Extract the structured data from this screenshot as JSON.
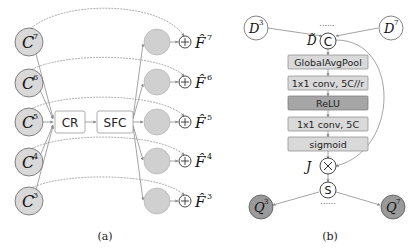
{
  "panel_a": {
    "caption": "(a)",
    "inputs": [
      {
        "base": "C",
        "sup": "7"
      },
      {
        "base": "C",
        "sup": "6"
      },
      {
        "base": "C",
        "sup": "5"
      },
      {
        "base": "C",
        "sup": "4"
      },
      {
        "base": "C",
        "sup": "3"
      }
    ],
    "cr_label": "CR",
    "sfc_label": "SFC",
    "outputs": [
      {
        "base": "F̂",
        "sup": "7"
      },
      {
        "base": "F̂",
        "sup": "6"
      },
      {
        "base": "F̂",
        "sup": "5"
      },
      {
        "base": "F̂",
        "sup": "4"
      },
      {
        "base": "F̂",
        "sup": "3"
      }
    ],
    "add_symbol": "+"
  },
  "panel_b": {
    "caption": "(b)",
    "d_left": {
      "base": "D",
      "sup": "3"
    },
    "d_right": {
      "base": "D",
      "sup": "7"
    },
    "dots_top": "......",
    "concat_label": "C",
    "d_tilde": "D̃",
    "layers": [
      {
        "label": "GlobalAvgPool",
        "fill": "#d9d9d9"
      },
      {
        "label": "1x1 conv, 5C//r",
        "fill": "#d9d9d9"
      },
      {
        "label": "ReLU",
        "fill": "#a6a6a6"
      },
      {
        "label": "1x1 conv, 5C",
        "fill": "#d9d9d9"
      },
      {
        "label": "sigmoid",
        "fill": "#d9d9d9"
      }
    ],
    "mult_symbol": "×",
    "j_label": "J",
    "split_label": "S",
    "dots_bottom": "......",
    "q_left": {
      "base": "Q",
      "sup": "3"
    },
    "q_right": {
      "base": "Q",
      "sup": "7"
    }
  },
  "colors": {
    "line": "#8c8c8c",
    "light_fill": "#d9d9d9",
    "mid_fill": "#c8c8c8",
    "dark_fill": "#a6a6a6",
    "q_fill": "#9a9a9a"
  }
}
